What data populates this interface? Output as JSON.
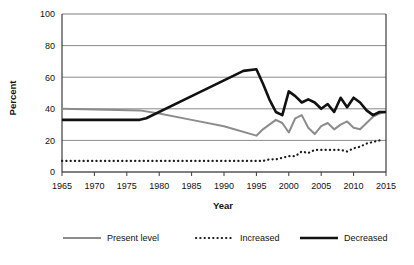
{
  "figure": {
    "caption": ""
  },
  "chart_data": {
    "type": "line",
    "title": "",
    "xlabel": "Year",
    "ylabel": "Percent",
    "xlim": [
      1965,
      2015
    ],
    "ylim": [
      0,
      100
    ],
    "xticks": [
      1965,
      1970,
      1975,
      1980,
      1985,
      1990,
      1995,
      2000,
      2005,
      2010,
      2015
    ],
    "yticks": [
      0,
      20,
      40,
      60,
      80,
      100
    ],
    "grid": "horizontal",
    "legend_position": "bottom",
    "series": [
      {
        "name": "Present level",
        "style": "solid",
        "color": "#8c8c8c",
        "width": 2.0,
        "points": [
          [
            1965,
            40
          ],
          [
            1977,
            39
          ],
          [
            1980,
            37
          ],
          [
            1985,
            33
          ],
          [
            1990,
            29
          ],
          [
            1995,
            23
          ],
          [
            1996,
            27
          ],
          [
            1997,
            30
          ],
          [
            1998,
            33
          ],
          [
            1999,
            31
          ],
          [
            2000,
            25
          ],
          [
            2001,
            34
          ],
          [
            2002,
            36
          ],
          [
            2003,
            28
          ],
          [
            2004,
            24
          ],
          [
            2005,
            29
          ],
          [
            2006,
            31
          ],
          [
            2007,
            27
          ],
          [
            2008,
            30
          ],
          [
            2009,
            32
          ],
          [
            2010,
            28
          ],
          [
            2011,
            27
          ],
          [
            2012,
            31
          ],
          [
            2013,
            35
          ],
          [
            2014,
            37
          ],
          [
            2015,
            38
          ]
        ]
      },
      {
        "name": "Increased",
        "style": "dotted",
        "color": "#1a1a1a",
        "width": 2.2,
        "points": [
          [
            1965,
            7
          ],
          [
            1966,
            7
          ],
          [
            1967,
            7
          ],
          [
            1968,
            7
          ],
          [
            1969,
            7
          ],
          [
            1970,
            7
          ],
          [
            1971,
            7
          ],
          [
            1972,
            7
          ],
          [
            1973,
            7
          ],
          [
            1974,
            7
          ],
          [
            1975,
            7
          ],
          [
            1976,
            7
          ],
          [
            1977,
            7
          ],
          [
            1978,
            7
          ],
          [
            1979,
            7
          ],
          [
            1980,
            7
          ],
          [
            1981,
            7
          ],
          [
            1982,
            7
          ],
          [
            1983,
            7
          ],
          [
            1984,
            7
          ],
          [
            1985,
            7
          ],
          [
            1986,
            7
          ],
          [
            1987,
            7
          ],
          [
            1988,
            7
          ],
          [
            1989,
            7
          ],
          [
            1990,
            7
          ],
          [
            1991,
            7
          ],
          [
            1992,
            7
          ],
          [
            1993,
            7
          ],
          [
            1994,
            7
          ],
          [
            1995,
            7
          ],
          [
            1996,
            7
          ],
          [
            1997,
            8
          ],
          [
            1998,
            8
          ],
          [
            1999,
            9
          ],
          [
            2000,
            10
          ],
          [
            2001,
            10
          ],
          [
            2002,
            13
          ],
          [
            2003,
            12
          ],
          [
            2004,
            14
          ],
          [
            2005,
            14
          ],
          [
            2006,
            14
          ],
          [
            2007,
            14
          ],
          [
            2008,
            14
          ],
          [
            2009,
            13
          ],
          [
            2010,
            15
          ],
          [
            2011,
            16
          ],
          [
            2012,
            18
          ],
          [
            2013,
            19
          ],
          [
            2014,
            20
          ]
        ]
      },
      {
        "name": "Decreased",
        "style": "solid",
        "color": "#111111",
        "width": 2.6,
        "points": [
          [
            1965,
            33
          ],
          [
            1977,
            33
          ],
          [
            1978,
            34
          ],
          [
            1985,
            48
          ],
          [
            1990,
            58
          ],
          [
            1993,
            64
          ],
          [
            1995,
            65
          ],
          [
            1996,
            56
          ],
          [
            1997,
            46
          ],
          [
            1998,
            38
          ],
          [
            1999,
            36
          ],
          [
            2000,
            51
          ],
          [
            2001,
            48
          ],
          [
            2002,
            44
          ],
          [
            2003,
            46
          ],
          [
            2004,
            44
          ],
          [
            2005,
            40
          ],
          [
            2006,
            43
          ],
          [
            2007,
            38
          ],
          [
            2008,
            47
          ],
          [
            2009,
            41
          ],
          [
            2010,
            47
          ],
          [
            2011,
            44
          ],
          [
            2012,
            39
          ],
          [
            2013,
            36
          ],
          [
            2014,
            38
          ],
          [
            2015,
            38
          ]
        ]
      }
    ]
  },
  "legend": {
    "items": [
      {
        "label": "Present level",
        "style": "solid",
        "color": "#8c8c8c"
      },
      {
        "label": "Increased",
        "style": "dotted",
        "color": "#1a1a1a"
      },
      {
        "label": "Decreased",
        "style": "solid",
        "color": "#111111"
      }
    ]
  }
}
